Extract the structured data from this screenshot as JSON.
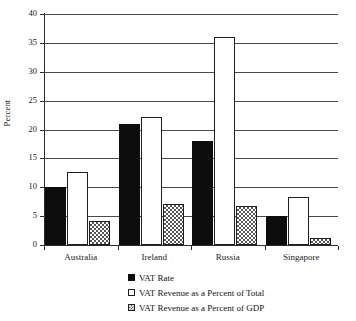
{
  "chart_data": {
    "type": "bar",
    "title": "",
    "xlabel": "",
    "ylabel": "Percent",
    "ylim": [
      0,
      40
    ],
    "yticks": [
      0,
      5,
      10,
      15,
      20,
      25,
      30,
      35,
      40
    ],
    "grid": true,
    "legend_position": "bottom",
    "categories": [
      "Australia",
      "Ireland",
      "Russia",
      "Singapore"
    ],
    "series": [
      {
        "name": "VAT Rate",
        "values": [
          10,
          21,
          18,
          5
        ],
        "style": "solid-black",
        "color": "#0d0d0d"
      },
      {
        "name": "VAT Revenue as a Percent of Total",
        "values": [
          12.7,
          22.1,
          36,
          8.4
        ],
        "style": "white-outline",
        "color": "#ffffff"
      },
      {
        "name": "VAT Revenue as a Percent of GDP",
        "values": [
          4.1,
          7.1,
          6.7,
          1.3
        ],
        "style": "checkered-hatch",
        "color": "#808080"
      }
    ]
  },
  "axis": {
    "y_title": "Percent",
    "tick_labels": [
      "0",
      "5",
      "10",
      "15",
      "20",
      "25",
      "30",
      "35",
      "40"
    ]
  },
  "legend": {
    "items": [
      {
        "label": "VAT Rate"
      },
      {
        "label": "VAT Revenue as a Percent of Total"
      },
      {
        "label": "VAT Revenue as a Percent of GDP"
      }
    ]
  }
}
